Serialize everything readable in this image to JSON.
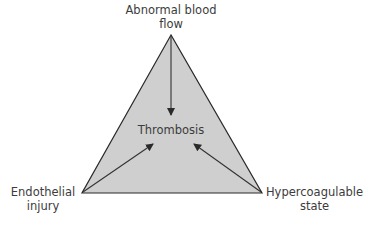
{
  "diagram": {
    "center_label": "Thrombosis",
    "vertices": {
      "top": {
        "line1": "Abnormal blood",
        "line2": "flow"
      },
      "left": {
        "line1": "Endothelial",
        "line2": "injury"
      },
      "right": {
        "line1": "Hypercoagulable",
        "line2": "state"
      }
    },
    "colors": {
      "fill": "#cfcfcf",
      "stroke": "#2a2a2a",
      "arrow": "#333333"
    }
  }
}
